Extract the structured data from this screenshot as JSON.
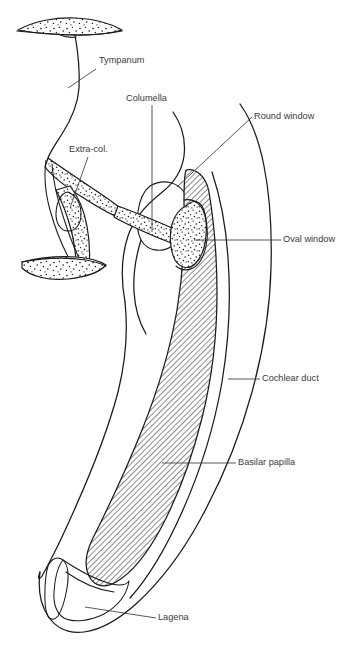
{
  "figure": {
    "background_color": "#ffffff",
    "ink_color": "#1a1a1a",
    "label_color": "#3a3a3a",
    "hatch_color": "#1a1a1a",
    "stipple_color": "#1a1a1a"
  },
  "labels": [
    {
      "id": "tympanum",
      "text": "Tympanum",
      "x": 99,
      "y": 61,
      "anchor": "start"
    },
    {
      "id": "columella",
      "text": "Columella",
      "x": 126,
      "y": 99,
      "anchor": "start"
    },
    {
      "id": "round_window",
      "text": "Round window",
      "x": 254,
      "y": 117,
      "anchor": "start"
    },
    {
      "id": "extra_col",
      "text": "Extra-col.",
      "x": 69,
      "y": 150,
      "anchor": "start"
    },
    {
      "id": "oval_window",
      "text": "Oval window",
      "x": 283,
      "y": 240,
      "anchor": "start"
    },
    {
      "id": "cochlear_duct",
      "text": "Cochlear duct",
      "x": 262,
      "y": 379,
      "anchor": "start"
    },
    {
      "id": "basilar_papilla",
      "text": "Basilar papilla",
      "x": 238,
      "y": 463,
      "anchor": "start"
    },
    {
      "id": "lagena",
      "text": "Lagena",
      "x": 158,
      "y": 618,
      "anchor": "start"
    }
  ],
  "leaders": [
    {
      "id": "tympanum-leader",
      "points": "96,69 68,88"
    },
    {
      "id": "columella-leader",
      "points": "152,105 152,232"
    },
    {
      "id": "round-window-leader",
      "points": "252,117 177,187"
    },
    {
      "id": "extra-col-leader",
      "points": "88,157 70,208"
    },
    {
      "id": "oval-window-leader",
      "points": "281,240 194,240"
    },
    {
      "id": "cochlear-duct-leader",
      "points": "260,379 228,379"
    },
    {
      "id": "basilar-papilla-leader",
      "points": "236,463 162,463"
    },
    {
      "id": "lagena-leader",
      "points": "156,618 85,607"
    }
  ],
  "structures": [
    {
      "id": "skin-stipple-band",
      "name": "stippled skin layer",
      "pattern": "stipple"
    },
    {
      "id": "tympanum-membrane",
      "name": "tympanic membrane",
      "pattern": "line"
    },
    {
      "id": "extracolumella",
      "name": "extra-columella cartilage",
      "pattern": "stipple"
    },
    {
      "id": "columella-shaft",
      "name": "columella shaft",
      "pattern": "stipple"
    },
    {
      "id": "stapes-footplate",
      "name": "footplate at oval window",
      "pattern": "stipple"
    },
    {
      "id": "otic-capsule",
      "name": "otic capsule outline",
      "pattern": "line"
    },
    {
      "id": "round-window-oval",
      "name": "round window membrane",
      "pattern": "line"
    },
    {
      "id": "basilar-papilla-band",
      "name": "basilar papilla",
      "pattern": "hatch"
    },
    {
      "id": "cochlear-duct-walls",
      "name": "cochlear duct walls",
      "pattern": "line"
    },
    {
      "id": "lagena-body",
      "name": "lagena",
      "pattern": "line"
    }
  ]
}
